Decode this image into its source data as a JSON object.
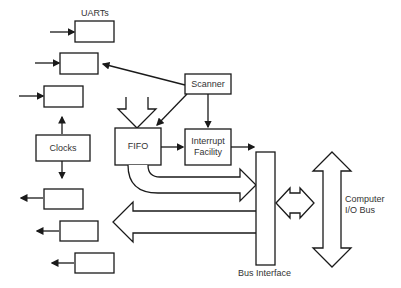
{
  "diagram": {
    "title_label": "UARTs",
    "scanner_label": "Scanner",
    "fifo_label": "FIFO",
    "interrupt_label_line1": "Interrupt",
    "interrupt_label_line2": "Facility",
    "clocks_label": "Clocks",
    "bus_interface_label": "Bus Interface",
    "computer_bus_label_line1": "Computer",
    "computer_bus_label_line2": "I/O Bus",
    "stroke_color": "#1a1a1a",
    "background_color": "#ffffff"
  }
}
